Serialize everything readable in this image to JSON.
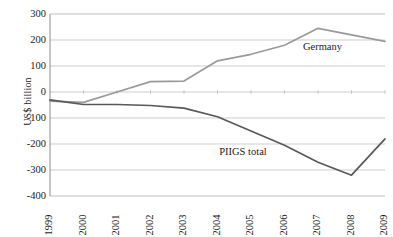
{
  "chart_data": {
    "type": "line",
    "title": "",
    "xlabel": "",
    "ylabel": "US$ billion",
    "categories": [
      "1999",
      "2000",
      "2001",
      "2002",
      "2003",
      "2004",
      "2005",
      "2006",
      "2007",
      "2008",
      "2009"
    ],
    "ylim": [
      -400,
      300
    ],
    "ytick_step": 100,
    "yticks": [
      300,
      200,
      100,
      0,
      -100,
      -200,
      -300,
      -400
    ],
    "ytick_labels": [
      "300",
      "200",
      "100",
      "0",
      "-100",
      "-200",
      "-300",
      "-400"
    ],
    "grid": "horizontal",
    "legend_position": "inline-annotation",
    "series": [
      {
        "name": "Germany",
        "color": "#9a9a9a",
        "label_x": 2006.55,
        "label_y": 175,
        "values": [
          -35,
          -40,
          0,
          40,
          42,
          120,
          145,
          180,
          245,
          220,
          195
        ]
      },
      {
        "name": "PIIGS total",
        "color": "#595959",
        "label_x": 2004.05,
        "label_y": -232,
        "values": [
          -30,
          -48,
          -48,
          -52,
          -62,
          -95,
          -150,
          -205,
          -270,
          -320,
          -180
        ]
      }
    ]
  },
  "axes": {
    "y_title": "US$ billion"
  }
}
